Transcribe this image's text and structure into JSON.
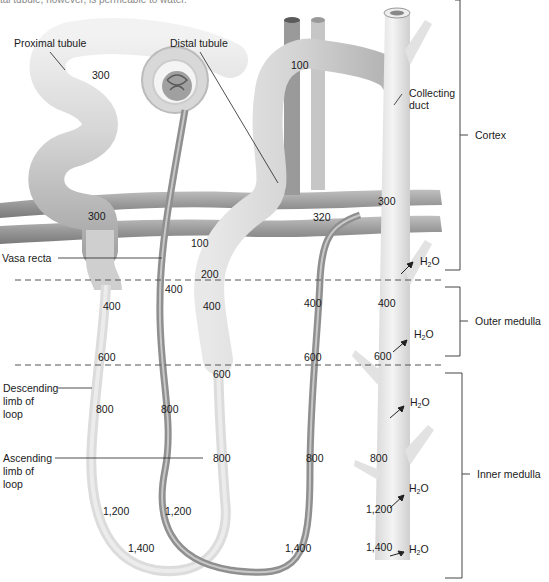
{
  "caption_partial": "tal tubule, however, is permeable to water.",
  "labels": {
    "proximal_tubule": "Proximal tubule",
    "distal_tubule": "Distal tubule",
    "collecting_duct_line1": "Collecting",
    "collecting_duct_line2": "duct",
    "vasa_recta": "Vasa recta",
    "descending_line1": "Descending",
    "descending_line2": "limb of",
    "descending_line3": "loop",
    "ascending_line1": "Ascending",
    "ascending_line2": "limb of",
    "ascending_line3": "loop"
  },
  "zones": {
    "cortex": "Cortex",
    "outer_medulla": "Outer medulla",
    "inner_medulla": "Inner medulla"
  },
  "water": {
    "h": "H",
    "sub": "2",
    "o": "O"
  },
  "osmolarity_values": {
    "proximal_300_top": "300",
    "proximal_300_lower": "300",
    "distal_100_top": "100",
    "ascending_100": "100",
    "ascending_200": "200",
    "ascending_400": "400",
    "ascending_600": "600",
    "ascending_800": "800",
    "ascending_1200": "1,200",
    "descending_400": "400",
    "descending_600": "600",
    "descending_800": "800",
    "descending_1200": "1,200",
    "loop_tip_1400": "1,400",
    "vasa_400": "400",
    "vasa_800": "800",
    "vasa_320": "320",
    "vasa_outer_400": "400",
    "vasa_outer_600": "600",
    "vasa_outer_800": "800",
    "vasa_bottom_1400": "1,400",
    "duct_300": "300",
    "duct_400": "400",
    "duct_600": "600",
    "duct_800": "800",
    "duct_1200": "1,200",
    "duct_1400": "1,400"
  },
  "colors": {
    "tubule_fill": "#d4d4d4",
    "tubule_shadow": "#a9a9a9",
    "vessel_dark": "#8a8a8a",
    "text": "#1a1a1a",
    "dashed_line": "#555555"
  }
}
